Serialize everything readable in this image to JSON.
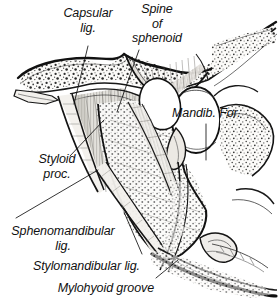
{
  "figure": {
    "kind": "anatomical-line-drawing",
    "background_color": "#ffffff",
    "ink_color": "#111111",
    "bone_fill_color": "#f6f4f0",
    "stipple_color": "#2b2b2b",
    "ligament_shade_color": "#9a968f"
  },
  "labels": [
    {
      "id": "capsular-lig",
      "name": "capsular-ligament-label",
      "lines": [
        "Capsular",
        "lig."
      ],
      "align": "center",
      "x": 52,
      "y": 6,
      "width": 72
    },
    {
      "id": "spine-of-sphenoid",
      "name": "spine-of-sphenoid-label",
      "lines": [
        "Spine",
        "of",
        "sphenoid"
      ],
      "align": "center",
      "x": 126,
      "y": 2,
      "width": 62
    },
    {
      "id": "mandib-for",
      "name": "mandibular-foramen-label",
      "lines": [
        "Mandib. For."
      ],
      "align": "left",
      "x": 172,
      "y": 106,
      "width": 86
    },
    {
      "id": "styloid-proc",
      "name": "styloid-process-label",
      "lines": [
        "Styloid",
        "proc."
      ],
      "align": "left",
      "x": 30,
      "y": 152,
      "width": 56
    },
    {
      "id": "sphenomandibular-lig",
      "name": "sphenomandibular-ligament-label",
      "lines": [
        "Sphenomandibular",
        "lig."
      ],
      "align": "center",
      "x": 6,
      "y": 224,
      "width": 112
    },
    {
      "id": "stylomandibular-lig",
      "name": "stylomandibular-ligament-label",
      "lines": [
        "Stylomandibular lig."
      ],
      "align": "right",
      "x": 16,
      "y": 259,
      "width": 122
    },
    {
      "id": "mylohyoid-groove",
      "name": "mylohyoid-groove-label",
      "lines": [
        "Mylohyoid groove"
      ],
      "align": "right",
      "x": 34,
      "y": 281,
      "width": 118
    }
  ],
  "leader_lines": [
    {
      "id": "capsular-leader",
      "from": [
        88,
        46
      ],
      "to": [
        74,
        104
      ]
    },
    {
      "id": "spine-leader",
      "from": [
        139,
        50
      ],
      "to": [
        116,
        114
      ]
    },
    {
      "id": "mandib-for-leader",
      "from": [
        206,
        122
      ],
      "to": [
        206,
        158
      ]
    },
    {
      "id": "styloid-leader",
      "from": [
        70,
        156
      ],
      "to": [
        106,
        118
      ]
    },
    {
      "id": "sphenomandibular-leader",
      "from": [
        18,
        218
      ],
      "to": [
        96,
        172
      ]
    },
    {
      "id": "stylomandibular-leader",
      "from": [
        140,
        256
      ],
      "to": [
        124,
        214
      ]
    },
    {
      "id": "mylohyoid-leader",
      "from": [
        155,
        278
      ],
      "to": [
        176,
        262
      ]
    }
  ],
  "structures": [
    {
      "id": "temporal-bone",
      "name": "temporal-bone-stippled",
      "description": "Cancellous stippled bone band across upper image"
    },
    {
      "id": "spine-sphenoid",
      "name": "spine-of-sphenoid-process",
      "description": "Downward bony spine, upper middle-right"
    },
    {
      "id": "capsular-ligament",
      "name": "capsular-ligament-fibers",
      "description": "Vertically striated fibrous capsule beneath temporal bone"
    },
    {
      "id": "styloid-process",
      "name": "styloid-process-bone",
      "description": "Slender tapering process descending left of ramus"
    },
    {
      "id": "mandibular-ramus",
      "name": "mandibular-ramus",
      "description": "Broad vertical plate of mandible"
    },
    {
      "id": "mandibular-foramen",
      "name": "mandibular-foramen-opening",
      "description": "Oval aperture on medial ramus"
    },
    {
      "id": "lingula",
      "name": "lingula-bone-flange",
      "description": "Tongue-shaped bony projection at foramen"
    },
    {
      "id": "sphenomandibular-ligament",
      "name": "sphenomandibular-ligament-band",
      "description": "Flat fibrous band from sphenoid spine to lingula"
    },
    {
      "id": "stylomandibular-ligament",
      "name": "stylomandibular-ligament-band",
      "description": "Band from styloid process to angle of mandible"
    },
    {
      "id": "mylohyoid-groove",
      "name": "mylohyoid-groove-channel",
      "description": "Oblique groove running down and forward from foramen"
    },
    {
      "id": "mandibular-body",
      "name": "mandibular-body-inferior-border",
      "description": "Lower border sweeping to the right"
    },
    {
      "id": "mandibular-angle",
      "name": "angle-of-mandible",
      "description": "Posterior inferior corner of ramus"
    },
    {
      "id": "coronoid-region",
      "name": "coronoid-and-condyle-region",
      "description": "Upper right bony margins"
    }
  ]
}
